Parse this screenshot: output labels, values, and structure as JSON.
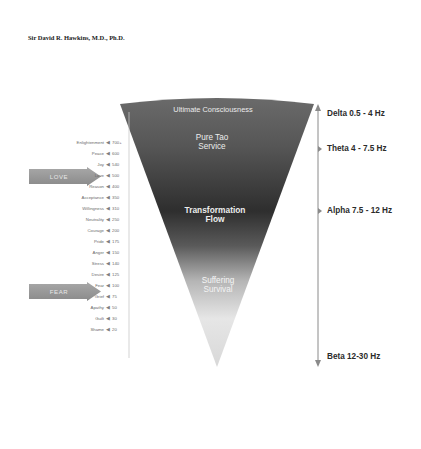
{
  "author": "Sir David R. Hawkins, M.D., Ph.D.",
  "funnel": {
    "top_label": "Ultimate Consciousness",
    "upper_label_line1": "Pure Tao",
    "upper_label_line2": "Service",
    "middle_label_line1": "Transformation",
    "middle_label_line2": "Flow",
    "lower_label_line1": "Suffering",
    "lower_label_line2": "Survival",
    "colors": {
      "top": "#5c5c5c",
      "middle": "#3a3a3a",
      "bottom": "#f2f2f2"
    }
  },
  "scale": {
    "levels": [
      {
        "name": "Enlightenment",
        "value": "700+"
      },
      {
        "name": "Peace",
        "value": "600"
      },
      {
        "name": "Joy",
        "value": "540"
      },
      {
        "name": "Love",
        "value": "500"
      },
      {
        "name": "Reason",
        "value": "400"
      },
      {
        "name": "Acceptance",
        "value": "350"
      },
      {
        "name": "Willingness",
        "value": "310"
      },
      {
        "name": "Neutrality",
        "value": "250"
      },
      {
        "name": "Courage",
        "value": "200"
      },
      {
        "name": "Pride",
        "value": "175"
      },
      {
        "name": "Anger",
        "value": "150"
      },
      {
        "name": "Stress",
        "value": "140"
      },
      {
        "name": "Desire",
        "value": "125"
      },
      {
        "name": "Fear",
        "value": "100"
      },
      {
        "name": "Grief",
        "value": "75"
      },
      {
        "name": "Apathy",
        "value": "50"
      },
      {
        "name": "Guilt",
        "value": "30"
      },
      {
        "name": "Shame",
        "value": "20"
      }
    ],
    "marker": "◀"
  },
  "pointers": {
    "love": "LOVE",
    "fear": "FEAR"
  },
  "brainwaves": [
    {
      "label": "Delta 0.5 - 4 Hz"
    },
    {
      "label": "Theta 4 - 7.5 Hz"
    },
    {
      "label": "Alpha 7.5 - 12 Hz"
    },
    {
      "label": "Beta 12-30 Hz"
    }
  ]
}
